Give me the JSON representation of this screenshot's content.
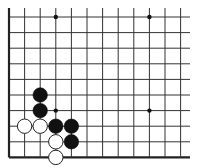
{
  "board": {
    "type": "go-board-fragment",
    "columns": 12,
    "rows": 10,
    "spacing": 15.6,
    "origin_x": 9,
    "origin_y": 17,
    "edges": {
      "left": true,
      "bottom": true,
      "top": false,
      "right": false
    },
    "line_color": "#333333",
    "edge_color": "#222222",
    "background": "#ffffff",
    "star_points": [
      {
        "col": 3,
        "row": 0
      },
      {
        "col": 9,
        "row": 0
      },
      {
        "col": 3,
        "row": 6
      },
      {
        "col": 9,
        "row": 6
      }
    ],
    "stones": [
      {
        "color": "black",
        "col": 2,
        "row": 5
      },
      {
        "color": "black",
        "col": 2,
        "row": 6
      },
      {
        "color": "white",
        "col": 1,
        "row": 7
      },
      {
        "color": "white",
        "col": 2,
        "row": 7
      },
      {
        "color": "black",
        "col": 3,
        "row": 7
      },
      {
        "color": "black",
        "col": 4,
        "row": 7
      },
      {
        "color": "white",
        "col": 3,
        "row": 8
      },
      {
        "color": "black",
        "col": 4,
        "row": 8
      },
      {
        "color": "white",
        "col": 3,
        "row": 9
      }
    ]
  }
}
